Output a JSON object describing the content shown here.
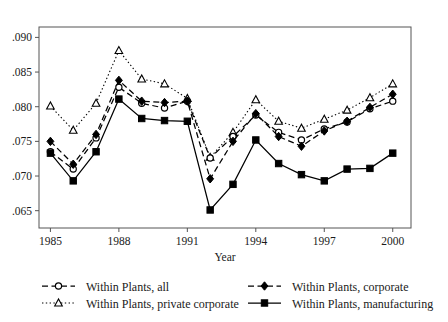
{
  "chart_data": {
    "type": "line",
    "title": "",
    "subtitle": "",
    "xlabel": "Year",
    "ylabel": "",
    "x": [
      1985,
      1986,
      1987,
      1988,
      1989,
      1990,
      1991,
      1992,
      1993,
      1994,
      1995,
      1996,
      1997,
      1998,
      1999,
      2000
    ],
    "xtick_labels": [
      "1985",
      "1988",
      "1991",
      "1994",
      "1997",
      "2000"
    ],
    "xtick_values": [
      1985,
      1988,
      1991,
      1994,
      1997,
      2000
    ],
    "xlim": [
      1984.5,
      2000.8
    ],
    "ytick_labels": [
      ".065",
      ".070",
      ".075",
      ".080",
      ".085",
      ".090"
    ],
    "ytick_values": [
      0.065,
      0.07,
      0.075,
      0.08,
      0.085,
      0.09
    ],
    "ylim": [
      0.0625,
      0.0915
    ],
    "grid": false,
    "legend_position": "below-plot",
    "series": [
      {
        "name": "Within Plants, all",
        "marker": "open-circle",
        "line_style": "dashed",
        "color": "#000000",
        "values": [
          0.0735,
          0.071,
          0.0755,
          0.0828,
          0.0805,
          0.0798,
          0.0808,
          0.0726,
          0.0757,
          0.0788,
          0.0763,
          0.0752,
          0.0768,
          0.0778,
          0.0797,
          0.0808
        ]
      },
      {
        "name": "Within Plants, private corporate",
        "marker": "open-triangle",
        "line_style": "dotted",
        "color": "#000000",
        "values": [
          0.0801,
          0.0766,
          0.0805,
          0.0881,
          0.084,
          0.0833,
          0.0812,
          0.0727,
          0.0763,
          0.081,
          0.0779,
          0.0769,
          0.0782,
          0.0795,
          0.0813,
          0.0833
        ]
      },
      {
        "name": "Within Plants, corporate",
        "marker": "filled-diamond",
        "line_style": "dashed",
        "color": "#000000",
        "values": [
          0.075,
          0.0717,
          0.076,
          0.0838,
          0.0808,
          0.0806,
          0.0808,
          0.0696,
          0.075,
          0.079,
          0.0757,
          0.0743,
          0.0765,
          0.0779,
          0.0799,
          0.0818
        ]
      },
      {
        "name": "Within Plants, manufacturing",
        "marker": "filled-square",
        "line_style": "solid",
        "color": "#000000",
        "values": [
          0.0733,
          0.0693,
          0.0735,
          0.0811,
          0.0783,
          0.078,
          0.0779,
          0.0651,
          0.0688,
          0.0752,
          0.0718,
          0.0702,
          0.0693,
          0.071,
          0.0711,
          0.0733
        ]
      }
    ]
  },
  "legend": {
    "entries": [
      {
        "label": "Within Plants, all",
        "marker": "open-circle",
        "line_style": "dashed"
      },
      {
        "label": "Within Plants, corporate",
        "marker": "filled-diamond",
        "line_style": "dashed"
      },
      {
        "label": "Within Plants, private corporate",
        "marker": "open-triangle",
        "line_style": "dotted"
      },
      {
        "label": "Within Plants, manufacturing",
        "marker": "filled-square",
        "line_style": "solid"
      }
    ]
  }
}
